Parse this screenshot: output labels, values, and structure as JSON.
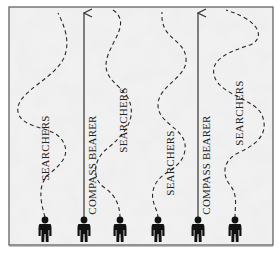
{
  "diagram": {
    "colors": {
      "background": "#ffffff",
      "field": "#ececec",
      "border": "#555555",
      "ink": "#1a1a1a"
    },
    "labels": {
      "searchers": "SEARCHERS",
      "compass_bearer": "COMPASS BEARER"
    },
    "lanes": [
      {
        "role": "searcher",
        "label": "SEARCHERS",
        "x": 45
      },
      {
        "role": "compass-bearer",
        "label": "COMPASS BEARER",
        "x": 84
      },
      {
        "role": "searcher",
        "label": "SEARCHERS",
        "x": 120
      },
      {
        "role": "searcher",
        "label": "SEARCHERS",
        "x": 158
      },
      {
        "role": "compass-bearer",
        "label": "COMPASS BEARER",
        "x": 198
      },
      {
        "role": "searcher",
        "label": "SEARCHERS",
        "x": 235
      }
    ],
    "figure_count": 6
  }
}
